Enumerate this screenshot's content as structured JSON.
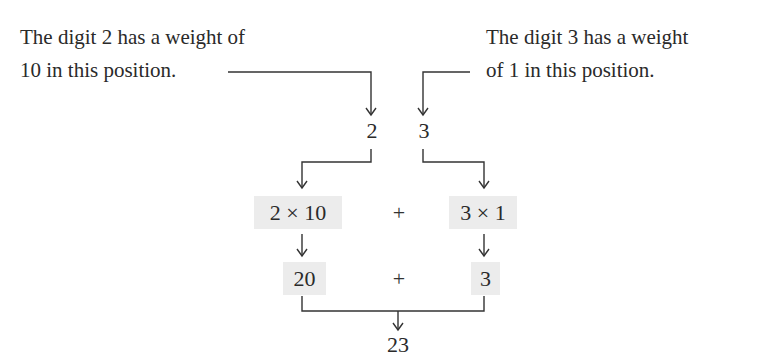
{
  "labels": {
    "left": [
      "The digit 2 has a weight of",
      "10 in this position."
    ],
    "right": [
      "The digit 3 has a weight",
      "of 1 in this position."
    ]
  },
  "number": {
    "digits": [
      "2",
      "3"
    ]
  },
  "expansion": {
    "terms": [
      "2 × 10",
      "3 × 1"
    ],
    "operator": "+",
    "products": [
      "20",
      "3"
    ],
    "product_operator": "+",
    "result": "23"
  },
  "colors": {
    "box_fill": "#ececec",
    "line": "#333333",
    "text": "#2a2a2a"
  }
}
